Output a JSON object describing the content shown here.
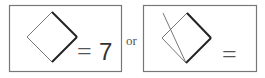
{
  "figure": {
    "left_panel": {
      "equals": "=",
      "value": "7"
    },
    "connector": "or",
    "right_panel": {
      "equals": "="
    }
  },
  "colors": {
    "frame": "#777777",
    "thin_line": "#666666",
    "bold_line": "#222222",
    "text": "#555555"
  }
}
